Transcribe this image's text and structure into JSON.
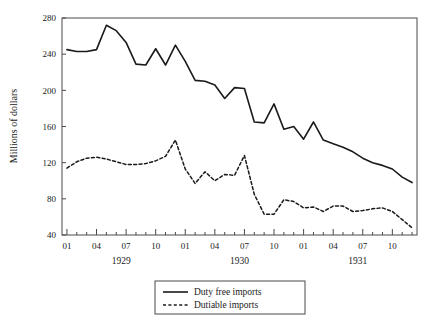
{
  "chart_data": {
    "type": "line",
    "title": "",
    "xlabel": "",
    "ylabel": "Millions of dollars",
    "ylim": [
      40,
      280
    ],
    "ytick_values": [
      40,
      80,
      120,
      160,
      200,
      240,
      280
    ],
    "ytick_labels": [
      "40",
      "80",
      "120",
      "160",
      "200",
      "240",
      "280"
    ],
    "grid": false,
    "legend_position": "bottom-center",
    "x_axis_style": "monthly ticks, labels every 3 months",
    "xtick_labels": [
      "01",
      "04",
      "07",
      "10",
      "01",
      "04",
      "07",
      "10",
      "01",
      "04",
      "07",
      "10"
    ],
    "xtick_indices": [
      0,
      3,
      6,
      9,
      12,
      15,
      18,
      21,
      24,
      27,
      30,
      33
    ],
    "year_group_labels": [
      "1929",
      "1930",
      "1931"
    ],
    "year_group_centers": [
      5.5,
      17.5,
      29.5
    ],
    "x": [
      "1929-01",
      "1929-02",
      "1929-03",
      "1929-04",
      "1929-05",
      "1929-06",
      "1929-07",
      "1929-08",
      "1929-09",
      "1929-10",
      "1929-11",
      "1929-12",
      "1930-01",
      "1930-02",
      "1930-03",
      "1930-04",
      "1930-05",
      "1930-06",
      "1930-07",
      "1930-08",
      "1930-09",
      "1930-10",
      "1930-11",
      "1930-12",
      "1931-01",
      "1931-02",
      "1931-03",
      "1931-04",
      "1931-05",
      "1931-06",
      "1931-07",
      "1931-08",
      "1931-09",
      "1931-10",
      "1931-11",
      "1931-12"
    ],
    "series": [
      {
        "name": "Duty free imports",
        "style": "solid",
        "color": "#1a1a1a",
        "values": [
          245,
          243,
          243,
          245,
          272,
          266,
          253,
          229,
          228,
          246,
          228,
          250,
          232,
          211,
          210,
          206,
          191,
          203,
          202,
          165,
          164,
          185,
          157,
          160,
          146,
          165,
          145,
          141,
          137,
          132,
          125,
          120,
          117,
          113,
          104,
          98
        ]
      },
      {
        "name": "Dutiable imports",
        "style": "dashed",
        "color": "#1a1a1a",
        "values": [
          114,
          121,
          125,
          126,
          124,
          121,
          118,
          118,
          119,
          122,
          127,
          145,
          113,
          97,
          110,
          100,
          107,
          106,
          128,
          85,
          63,
          63,
          79,
          77,
          70,
          71,
          66,
          72,
          72,
          66,
          67,
          69,
          70,
          66,
          57,
          48
        ]
      }
    ],
    "legend": [
      {
        "label": "Duty free imports",
        "style": "solid"
      },
      {
        "label": "Dutiable imports",
        "style": "dashed"
      }
    ]
  }
}
